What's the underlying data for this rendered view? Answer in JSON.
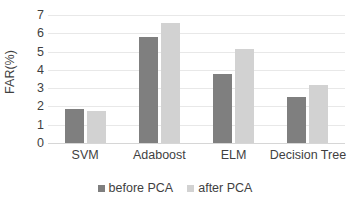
{
  "chart_data": {
    "type": "bar",
    "title": "",
    "xlabel": "",
    "ylabel": "FAR(%)",
    "categories": [
      "SVM",
      "Adaboost",
      "ELM",
      "Decision Tree"
    ],
    "series": [
      {
        "name": "before PCA",
        "color": "#7f7f7f",
        "values": [
          1.85,
          5.8,
          3.8,
          2.5
        ]
      },
      {
        "name": "after PCA",
        "color": "#d2d2d2",
        "values": [
          1.75,
          6.55,
          5.15,
          3.15
        ]
      }
    ],
    "ylim": [
      0,
      7
    ],
    "yticks": [
      0,
      1,
      2,
      3,
      4,
      5,
      6,
      7
    ],
    "ytick_labels": [
      "0",
      "1",
      "2",
      "3",
      "4",
      "5",
      "6",
      "7"
    ],
    "grid": true,
    "grid_color": "#e8e8e8",
    "legend_position": "bottom",
    "background": "#ffffff"
  },
  "axis": {
    "y_title": "FAR(%)"
  },
  "legend": {
    "items": [
      {
        "label": "before PCA",
        "color": "#7f7f7f"
      },
      {
        "label": "after PCA",
        "color": "#d2d2d2"
      }
    ]
  }
}
